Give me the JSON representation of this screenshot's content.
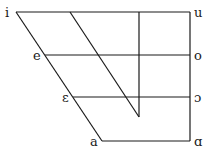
{
  "diagram": {
    "type": "vowel-chart",
    "front_vowels": [
      {
        "symbol": "i",
        "height": "close"
      },
      {
        "symbol": "e",
        "height": "close-mid"
      },
      {
        "symbol": "ɛ",
        "height": "open-mid"
      },
      {
        "symbol": "a",
        "height": "open"
      }
    ],
    "back_vowels": [
      {
        "symbol": "u",
        "height": "close"
      },
      {
        "symbol": "o",
        "height": "close-mid"
      },
      {
        "symbol": "ɔ",
        "height": "open-mid"
      },
      {
        "symbol": "ɑ",
        "height": "open"
      }
    ]
  }
}
